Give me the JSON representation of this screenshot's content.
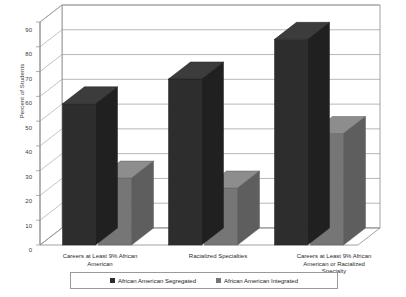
{
  "chart_data": {
    "type": "bar",
    "title": "",
    "subtitle": "",
    "xlabel": "",
    "ylabel": "Percent of Students",
    "ylim": [
      0,
      90
    ],
    "ytick_step": 10,
    "yticks": [
      0,
      10,
      20,
      30,
      40,
      50,
      60,
      70,
      80,
      90
    ],
    "grid": true,
    "three_d": true,
    "legend_position": "bottom",
    "categories": [
      "Careers at Least 9% African American",
      "Racialized Specialties",
      "Careers at Least 9% African American or Racialized Specialty"
    ],
    "series": [
      {
        "name": "African American Segregated",
        "color": "#2d2d2d",
        "values": [
          57,
          67,
          83
        ]
      },
      {
        "name": "African American Integrated",
        "color": "#767676",
        "values": [
          27,
          23,
          45
        ]
      }
    ]
  },
  "axis": {
    "y_title": "Percent of Students",
    "tick_labels": [
      "90",
      "80",
      "70",
      "60",
      "50",
      "40",
      "30",
      "20",
      "10",
      "0"
    ]
  },
  "categories_display": [
    "Careers at Least 9% African\nAmerican",
    "Racialized Specialties",
    "Careers at Least 9% African\nAmerican or Racialized\nSpecialty"
  ],
  "legend": {
    "items": [
      {
        "label": "African American Segregated",
        "color": "#2d2d2d"
      },
      {
        "label": "African American Integrated",
        "color": "#767676"
      }
    ]
  },
  "colors": {
    "series_dark": "#2d2d2d",
    "series_dark_top": "#3c3c3c",
    "series_dark_side": "#202020",
    "series_light": "#767676",
    "series_light_top": "#8d8d8d",
    "series_light_side": "#5e5e5e",
    "gridline": "#9a9a9a",
    "axis": "#8c8c8c",
    "background": "#ffffff"
  }
}
